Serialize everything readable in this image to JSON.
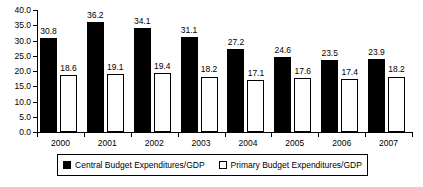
{
  "chart_data": {
    "type": "bar",
    "title": "",
    "subtitle": "",
    "xlabel": "",
    "ylabel": "",
    "categories": [
      "2000",
      "2001",
      "2002",
      "2003",
      "2004",
      "2005",
      "2006",
      "2007"
    ],
    "series": [
      {
        "name": "Central Budget Expenditures/GDP",
        "style": "filled-black",
        "color": "#000000",
        "values": [
          30.8,
          36.2,
          34.1,
          31.1,
          27.2,
          24.6,
          23.5,
          23.9
        ]
      },
      {
        "name": "Primary Budget Expenditures/GDP",
        "style": "hollow-white",
        "color": "#ffffff",
        "values": [
          18.6,
          19.1,
          19.4,
          18.2,
          17.1,
          17.6,
          17.4,
          18.2
        ]
      }
    ],
    "ylim": [
      0.0,
      40.0
    ],
    "ytick_step": 5.0,
    "ytick_labels": [
      "40.0",
      "35.0",
      "30.0",
      "25.0",
      "20.0",
      "15.0",
      "10.0",
      "5.0",
      "0.0"
    ],
    "ytick_values": [
      40.0,
      35.0,
      30.0,
      25.0,
      20.0,
      15.0,
      10.0,
      5.0,
      0.0
    ],
    "data_labels_shown": true,
    "grid": false,
    "legend_position": "bottom"
  },
  "legend": {
    "items": [
      {
        "label": "Central Budget Expenditures/GDP",
        "swatch": "filled"
      },
      {
        "label": "Primary Budget Expenditures/GDP",
        "swatch": "hollow"
      }
    ]
  }
}
